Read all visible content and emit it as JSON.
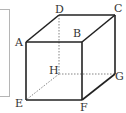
{
  "figure": {
    "type": "cube",
    "vertices": {
      "A": {
        "label": "A",
        "x": 26,
        "y": 42
      },
      "B": {
        "label": "B",
        "x": 82,
        "y": 42
      },
      "C": {
        "label": "C",
        "x": 115,
        "y": 15
      },
      "D": {
        "label": "D",
        "x": 59,
        "y": 15
      },
      "E": {
        "label": "E",
        "x": 26,
        "y": 100
      },
      "F": {
        "label": "F",
        "x": 82,
        "y": 100
      },
      "G": {
        "label": "G",
        "x": 115,
        "y": 74
      },
      "H": {
        "label": "H",
        "x": 59,
        "y": 74
      }
    },
    "solid_edges": [
      "AB",
      "BC",
      "CD",
      "DA",
      "AE",
      "BF",
      "CG",
      "EF",
      "FG"
    ],
    "hidden_edges": [
      "DH",
      "EH",
      "HG"
    ],
    "colors": {
      "edge": "#222222",
      "hidden_edge": "#777777",
      "frame_border": "#b5b5b5"
    }
  }
}
